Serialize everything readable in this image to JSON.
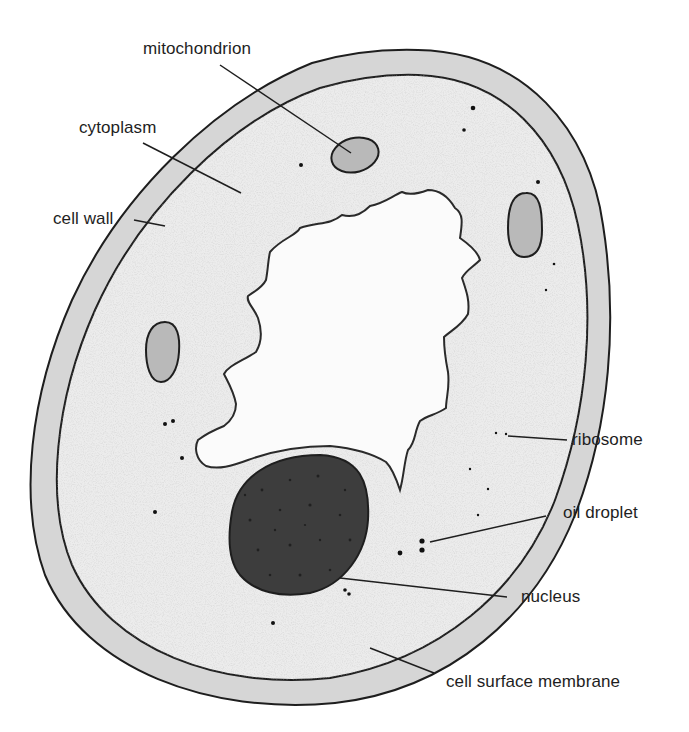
{
  "diagram": {
    "type": "labelled biological diagram",
    "colors": {
      "background": "#ffffff",
      "cell_wall": "#d6d6d6",
      "cytoplasm": "#ececec",
      "vacuole": "#fbfbfb",
      "mitochondrion": "#b9b9b9",
      "nucleus": "#3a3a3a",
      "outline": "#1e1e1e"
    }
  },
  "labels": {
    "mitochondrion": "mitochondrion",
    "cytoplasm": "cytoplasm",
    "cell_wall": "cell wall",
    "ribosome": "ribosome",
    "oil_droplet": "oil droplet",
    "nucleus": "nucleus",
    "cell_surface_membrane": "cell surface membrane"
  }
}
